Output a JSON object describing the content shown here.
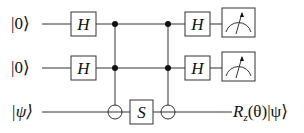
{
  "diagram": {
    "type": "quantum-circuit",
    "inputs": [
      "|0⟩",
      "|0⟩",
      "|ψ⟩"
    ],
    "gates": {
      "h1_top": "H",
      "h1_mid": "H",
      "s": "S",
      "h2_top": "H",
      "h2_mid": "H"
    },
    "output_label": "R_z(θ)|ψ⟩",
    "output_parts": {
      "r": "R",
      "sub": "z",
      "rest": "(θ)|ψ⟩"
    },
    "elements": [
      "toffoli-1 (controls q0,q1; target q2)",
      "S on q2",
      "toffoli-2 (controls q0,q1; target q2)",
      "measure q0",
      "measure q1"
    ]
  }
}
